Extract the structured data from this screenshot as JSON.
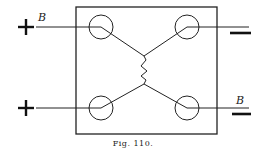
{
  "figure": {
    "caption": "Fig. 110.",
    "labels": {
      "top_left": "B",
      "bottom_right": "B"
    },
    "terminals": {
      "top_left": "+",
      "bottom_left": "+",
      "top_right": "−",
      "bottom_right": "−"
    },
    "colors": {
      "ink": "#222222",
      "background": "#ffffff"
    }
  }
}
